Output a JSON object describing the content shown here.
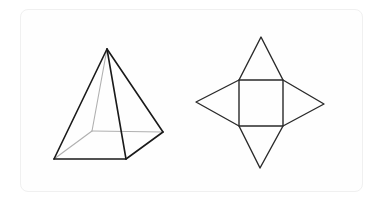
{
  "figure": {
    "pyramid": {
      "apex": [
        107,
        49
      ],
      "base_front_left": [
        54,
        159
      ],
      "base_front_right": [
        126,
        159
      ],
      "base_back_right": [
        163,
        132
      ],
      "base_back_left_hidden": [
        92,
        131
      ],
      "visible_color": "#1a1a1a",
      "hidden_color": "#b0b0b0"
    },
    "net": {
      "square": [
        [
          239,
          80
        ],
        [
          283,
          80
        ],
        [
          283,
          126
        ],
        [
          239,
          126
        ]
      ],
      "top_apex": [
        261,
        37
      ],
      "left_apex": [
        196,
        102
      ],
      "right_apex": [
        324,
        104
      ],
      "bottom_apex": [
        260,
        168
      ],
      "color": "#2a2a2a"
    }
  }
}
